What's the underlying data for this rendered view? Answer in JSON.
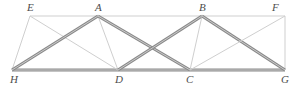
{
  "figure": {
    "type": "line-diagram",
    "width": 297,
    "height": 88,
    "background_color": "#ffffff"
  },
  "style": {
    "chord_color": "#c9c9c9",
    "light_member_color": "#cfcfcf",
    "dark_member_color": "#9b9b9b",
    "dark_member_edge_color": "#8a8a8a",
    "label_color": "#4d4d4d",
    "thin_width": 1,
    "thick_width": 3
  },
  "nodes": [
    {
      "id": "E",
      "label": "E",
      "x": 30,
      "y": 16,
      "label_x": 27,
      "label_y": 2,
      "chord": "top"
    },
    {
      "id": "A",
      "label": "A",
      "x": 98,
      "y": 16,
      "label_x": 95,
      "label_y": 2,
      "chord": "top"
    },
    {
      "id": "B",
      "label": "B",
      "x": 202,
      "y": 16,
      "label_x": 199,
      "label_y": 2,
      "chord": "top"
    },
    {
      "id": "F",
      "label": "F",
      "x": 285,
      "y": 16,
      "label_x": 272,
      "label_y": 2,
      "chord": "top"
    },
    {
      "id": "H",
      "label": "H",
      "x": 12,
      "y": 70,
      "label_x": 10,
      "label_y": 74,
      "chord": "bottom"
    },
    {
      "id": "D",
      "label": "D",
      "x": 118,
      "y": 70,
      "label_x": 115,
      "label_y": 74,
      "chord": "bottom"
    },
    {
      "id": "C",
      "label": "C",
      "x": 190,
      "y": 70,
      "label_x": 186,
      "label_y": 74,
      "chord": "bottom"
    },
    {
      "id": "G",
      "label": "G",
      "x": 285,
      "y": 70,
      "label_x": 281,
      "label_y": 74,
      "chord": "bottom"
    }
  ],
  "members": [
    {
      "id": "EF",
      "from": "E",
      "to": "F",
      "weight": "thin",
      "name": "top-chord"
    },
    {
      "id": "HG",
      "from": "H",
      "to": "G",
      "weight": "thick",
      "name": "bottom-chord"
    },
    {
      "id": "EH",
      "from": "E",
      "to": "H",
      "weight": "thin",
      "name": "left-end-post"
    },
    {
      "id": "FG",
      "from": "F",
      "to": "G",
      "weight": "thin",
      "name": "right-end-post"
    },
    {
      "id": "ED",
      "from": "E",
      "to": "D",
      "weight": "thin",
      "name": "diagonal-e-d"
    },
    {
      "id": "HA",
      "from": "H",
      "to": "A",
      "weight": "thick",
      "name": "diagonal-h-a"
    },
    {
      "id": "AD",
      "from": "A",
      "to": "D",
      "weight": "thin",
      "name": "diagonal-a-d"
    },
    {
      "id": "AC",
      "from": "A",
      "to": "C",
      "weight": "thick",
      "name": "diagonal-a-c"
    },
    {
      "id": "DB",
      "from": "D",
      "to": "B",
      "weight": "thick",
      "name": "diagonal-d-b"
    },
    {
      "id": "BC",
      "from": "B",
      "to": "C",
      "weight": "thin",
      "name": "diagonal-b-c"
    },
    {
      "id": "BG",
      "from": "B",
      "to": "G",
      "weight": "thick",
      "name": "diagonal-b-g"
    },
    {
      "id": "CF",
      "from": "C",
      "to": "F",
      "weight": "thin",
      "name": "diagonal-c-f"
    }
  ]
}
